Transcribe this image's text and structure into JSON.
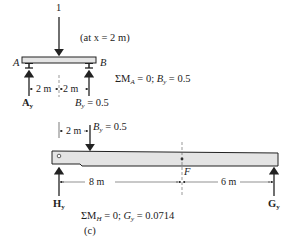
{
  "top": {
    "load_value": "1",
    "load_note": "(at x = 2 m)",
    "support_a_label": "A",
    "support_b_label": "B",
    "dim_left": "2 m",
    "dim_right": "2 m",
    "reaction_a": "A",
    "reaction_a_sub": "y",
    "reaction_b_prefix": "B",
    "reaction_b_sub": "y",
    "reaction_b_value": " = 0.5",
    "equation": {
      "sigma": "ΣM",
      "sigma_sub": "A",
      "mid": " = 0; ",
      "var": "B",
      "var_sub": "y",
      "value": " = 0.5"
    }
  },
  "bottom": {
    "dim_left": "2 m",
    "load_prefix": "B",
    "load_sub": "y",
    "load_value": " = 0.5",
    "point_f_label": "F",
    "dim_8": "8 m",
    "dim_6": "6 m",
    "reaction_h": "H",
    "reaction_h_sub": "y",
    "reaction_g": "G",
    "reaction_g_sub": "y",
    "equation": {
      "sigma": "ΣM",
      "sigma_sub": "H",
      "mid": " = 0; ",
      "var": "G",
      "var_sub": "y",
      "value": " = 0.0714"
    },
    "caption": "(c)"
  },
  "colors": {
    "beam_fill": "#e4e4e4",
    "line": "#222222"
  }
}
